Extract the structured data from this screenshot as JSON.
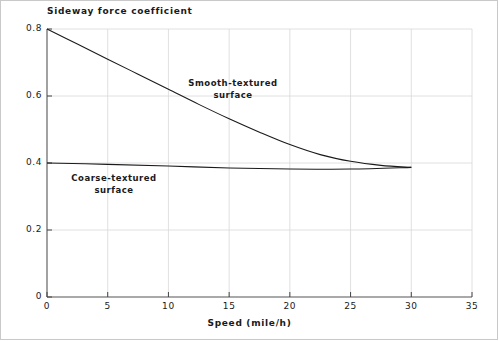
{
  "chart_data": {
    "type": "line",
    "title": "Sideway force coefficient",
    "xlabel": "Speed (mile/h)",
    "ylabel": "Sideway force coefficient",
    "xlim": [
      0,
      35
    ],
    "ylim": [
      0,
      0.8
    ],
    "xticks": [
      0,
      5,
      10,
      15,
      20,
      25,
      30,
      35
    ],
    "xtick_labels": [
      "0",
      "5",
      "10",
      "15",
      "20",
      "25",
      "30",
      "35"
    ],
    "yticks": [
      0,
      0.2,
      0.4,
      0.6,
      0.8
    ],
    "ytick_labels": [
      "0",
      "0.2",
      "0.4",
      "0.6",
      "0.8"
    ],
    "grid": true,
    "grid_color": "#d8d8d8",
    "line_color": "#1a1a1a",
    "legend_position": "inline-annotations",
    "series": [
      {
        "name": "Smooth-textured surface",
        "label_lines": [
          "Smooth-textured",
          "surface"
        ],
        "x": [
          0,
          2.5,
          5,
          7.5,
          10,
          12.5,
          15,
          17.5,
          20,
          22.5,
          25,
          27.5,
          30
        ],
        "values": [
          0.8,
          0.755,
          0.71,
          0.665,
          0.62,
          0.575,
          0.532,
          0.492,
          0.455,
          0.425,
          0.405,
          0.393,
          0.387
        ]
      },
      {
        "name": "Coarse-textured surface",
        "label_lines": [
          "Coarse-textured",
          "surface"
        ],
        "x": [
          0,
          5,
          10,
          15,
          20,
          25,
          30
        ],
        "values": [
          0.4,
          0.396,
          0.391,
          0.385,
          0.382,
          0.382,
          0.387
        ]
      }
    ],
    "annotations": [
      {
        "text": "Smooth-textured surface",
        "x": 15.2,
        "y": 0.63
      },
      {
        "text": "Coarse-textured surface",
        "x": 5.4,
        "y": 0.345
      }
    ]
  }
}
